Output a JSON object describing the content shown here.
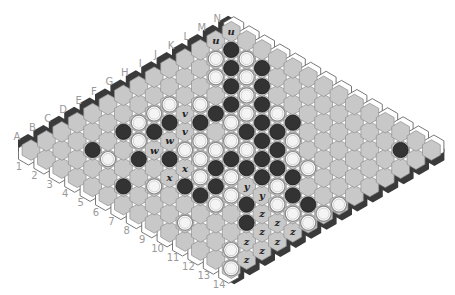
{
  "board": {
    "size": 14,
    "columns": [
      "A",
      "B",
      "C",
      "D",
      "E",
      "F",
      "G",
      "H",
      "I",
      "J",
      "K",
      "L",
      "M",
      "N"
    ],
    "rows": [
      "1",
      "2",
      "3",
      "4",
      "5",
      "6",
      "7",
      "8",
      "9",
      "10",
      "11",
      "12",
      "13",
      "14"
    ],
    "colors": {
      "cell": "#c8c8c8",
      "cell_stroke": "#8e8e8e",
      "black_edge": "#3a3a3a",
      "white_edge": "#ffffff",
      "black_stone": "#333333",
      "white_stone": "#f4f4f4",
      "background": "#ffffff"
    }
  },
  "stones": [
    {
      "cell": "M2",
      "color": "black"
    },
    {
      "cell": "L2",
      "color": "white"
    },
    {
      "cell": "M3",
      "color": "white"
    },
    {
      "cell": "L3",
      "color": "black"
    },
    {
      "cell": "M4",
      "color": "black"
    },
    {
      "cell": "K3",
      "color": "white"
    },
    {
      "cell": "L4",
      "color": "white"
    },
    {
      "cell": "K4",
      "color": "black"
    },
    {
      "cell": "L5",
      "color": "black"
    },
    {
      "cell": "K5",
      "color": "white"
    },
    {
      "cell": "H3",
      "color": "white"
    },
    {
      "cell": "I4",
      "color": "white"
    },
    {
      "cell": "J5",
      "color": "black"
    },
    {
      "cell": "K6",
      "color": "black"
    },
    {
      "cell": "I5",
      "color": "black"
    },
    {
      "cell": "J6",
      "color": "white"
    },
    {
      "cell": "K7",
      "color": "white"
    },
    {
      "cell": "G4",
      "color": "black"
    },
    {
      "cell": "H5",
      "color": "black"
    },
    {
      "cell": "I6",
      "color": "white"
    },
    {
      "cell": "J7",
      "color": "black"
    },
    {
      "cell": "K8",
      "color": "black"
    },
    {
      "cell": "I7",
      "color": "black"
    },
    {
      "cell": "J8",
      "color": "black"
    },
    {
      "cell": "G6",
      "color": "white"
    },
    {
      "cell": "H7",
      "color": "white"
    },
    {
      "cell": "I8",
      "color": "black"
    },
    {
      "cell": "J9",
      "color": "white"
    },
    {
      "cell": "F6",
      "color": "white"
    },
    {
      "cell": "G7",
      "color": "white"
    },
    {
      "cell": "H8",
      "color": "white"
    },
    {
      "cell": "I9",
      "color": "black"
    },
    {
      "cell": "F7",
      "color": "white"
    },
    {
      "cell": "G8",
      "color": "black"
    },
    {
      "cell": "H9",
      "color": "black"
    },
    {
      "cell": "I10",
      "color": "white"
    },
    {
      "cell": "I11",
      "color": "white"
    },
    {
      "cell": "G3",
      "color": "white"
    },
    {
      "cell": "F3",
      "color": "white"
    },
    {
      "cell": "E3",
      "color": "black"
    },
    {
      "cell": "F4",
      "color": "black"
    },
    {
      "cell": "E4",
      "color": "white"
    },
    {
      "cell": "C3",
      "color": "black"
    },
    {
      "cell": "D5",
      "color": "black"
    },
    {
      "cell": "E6",
      "color": "black"
    },
    {
      "cell": "C4",
      "color": "white"
    },
    {
      "cell": "B6",
      "color": "black"
    },
    {
      "cell": "C7",
      "color": "white"
    },
    {
      "cell": "D8",
      "color": "black"
    },
    {
      "cell": "B10",
      "color": "white"
    },
    {
      "cell": "F8",
      "color": "black"
    },
    {
      "cell": "G9",
      "color": "black"
    },
    {
      "cell": "G10",
      "color": "black"
    },
    {
      "cell": "H10",
      "color": "black"
    },
    {
      "cell": "H11",
      "color": "black"
    },
    {
      "cell": "E8",
      "color": "white"
    },
    {
      "cell": "F9",
      "color": "white"
    },
    {
      "cell": "E9",
      "color": "black"
    },
    {
      "cell": "G11",
      "color": "white"
    },
    {
      "cell": "D9",
      "color": "black"
    },
    {
      "cell": "E10",
      "color": "white"
    },
    {
      "cell": "G12",
      "color": "black"
    },
    {
      "cell": "D10",
      "color": "white"
    },
    {
      "cell": "E11",
      "color": "black"
    },
    {
      "cell": "F12",
      "color": "white"
    },
    {
      "cell": "G13",
      "color": "black"
    },
    {
      "cell": "H14",
      "color": "white"
    },
    {
      "cell": "F13",
      "color": "white"
    },
    {
      "cell": "G14",
      "color": "white"
    },
    {
      "cell": "F14",
      "color": "white"
    },
    {
      "cell": "D12",
      "color": "black"
    },
    {
      "cell": "B13",
      "color": "white"
    },
    {
      "cell": "A14",
      "color": "white"
    },
    {
      "cell": "M13",
      "color": "black"
    }
  ],
  "marks": [
    {
      "cell": "N1",
      "label": "u"
    },
    {
      "cell": "M1",
      "label": "u"
    },
    {
      "cell": "H4",
      "label": "v"
    },
    {
      "cell": "G5",
      "label": "v"
    },
    {
      "cell": "F5",
      "label": "w"
    },
    {
      "cell": "E5",
      "label": "w"
    },
    {
      "cell": "E7",
      "label": "x"
    },
    {
      "cell": "D7",
      "label": "x"
    },
    {
      "cell": "F10",
      "label": "y"
    },
    {
      "cell": "F11",
      "label": "y"
    },
    {
      "cell": "E12",
      "label": "z"
    },
    {
      "cell": "E13",
      "label": "z"
    },
    {
      "cell": "D13",
      "label": "z"
    },
    {
      "cell": "E14",
      "label": "z"
    },
    {
      "cell": "C13",
      "label": "z"
    },
    {
      "cell": "D14",
      "label": "z"
    },
    {
      "cell": "C14",
      "label": "z"
    },
    {
      "cell": "B14",
      "label": "z"
    }
  ]
}
